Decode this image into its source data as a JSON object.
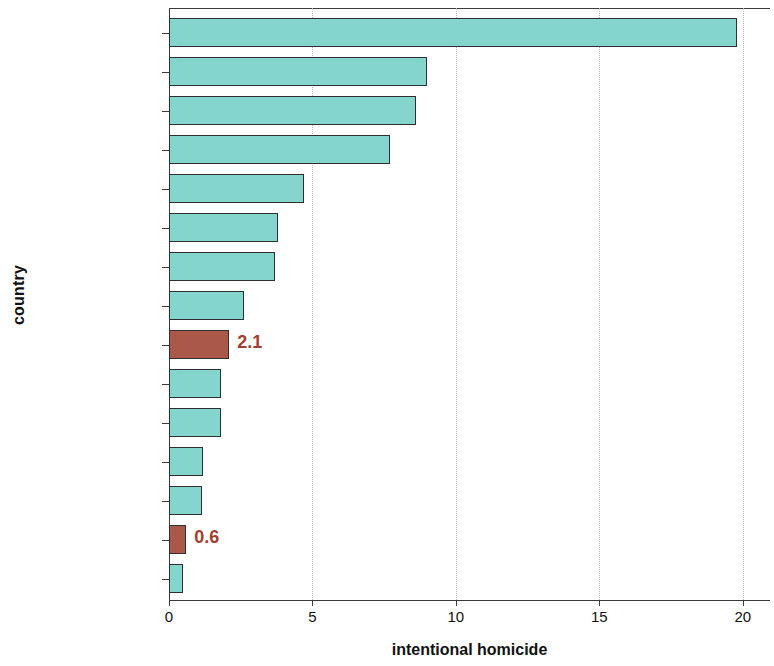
{
  "chart_data": {
    "type": "bar",
    "orientation": "horizontal",
    "title": "",
    "xlabel": "intentional homicide",
    "ylabel": "country",
    "xlim": [
      0,
      20.95
    ],
    "xticks": [
      0,
      5,
      10,
      15,
      20
    ],
    "xticklabels": [
      "0",
      "5",
      "10",
      "15",
      "20"
    ],
    "grid": "vertical-dotted",
    "legend": "none",
    "colors": {
      "default_bar": "#84d5cd",
      "highlight_bar": "#a9584a",
      "bar_outline": "#2f2f2f",
      "value_label": "#a2402f",
      "gridline": "#b9b9b9",
      "axis": "#3a3a3a"
    },
    "categories": [
      "Russian\nFederation (2000)",
      "Ukraine (2000)",
      "Thailand (2000)",
      "Philippines (2000)",
      "USA (2000)",
      "India (1999)",
      "Macau (1994)",
      "Malaysia (2000)",
      "mainland\nChina (1997)",
      "England &\nWales (2000)",
      "Australia (2000)",
      "Indonesia (2000)",
      "Singapore (2000)",
      "Hong Kong (2000)",
      "Japan (2000)"
    ],
    "values": [
      19.8,
      9.0,
      8.6,
      7.7,
      4.7,
      3.8,
      3.7,
      2.6,
      2.1,
      1.8,
      1.8,
      1.2,
      1.15,
      0.6,
      0.5
    ],
    "highlighted": [
      false,
      false,
      false,
      false,
      false,
      false,
      false,
      false,
      true,
      false,
      false,
      false,
      false,
      true,
      false
    ],
    "value_labels": [
      "",
      "",
      "",
      "",
      "",
      "",
      "",
      "",
      "2.1",
      "",
      "",
      "",
      "",
      "0.6",
      ""
    ]
  }
}
